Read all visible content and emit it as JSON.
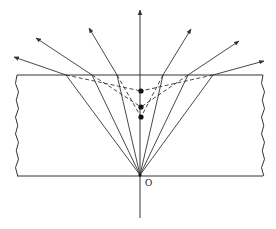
{
  "diagram": {
    "colors": {
      "line": "#333333",
      "background": "#ffffff"
    },
    "origin_label": "O",
    "slab": {
      "top_y": 75,
      "bottom_y": 176,
      "left_x": 17,
      "right_x": 263
    },
    "source": {
      "x": 140,
      "y": 175
    },
    "axis": {
      "x": 140,
      "y_top": 10,
      "y_bottom": 218
    },
    "rays": [
      {
        "exit_x": 66,
        "end": [
          14,
          57
        ]
      },
      {
        "exit_x": 92,
        "end": [
          36,
          38
        ]
      },
      {
        "exit_x": 117,
        "end": [
          89,
          28
        ]
      },
      {
        "exit_x": 163,
        "end": [
          191,
          29
        ]
      },
      {
        "exit_x": 188,
        "end": [
          239,
          41
        ]
      },
      {
        "exit_x": 213,
        "end": [
          264,
          61
        ]
      }
    ],
    "image_points": [
      {
        "x": 141,
        "y": 91
      },
      {
        "x": 141,
        "y": 107
      },
      {
        "x": 141,
        "y": 117
      }
    ]
  }
}
